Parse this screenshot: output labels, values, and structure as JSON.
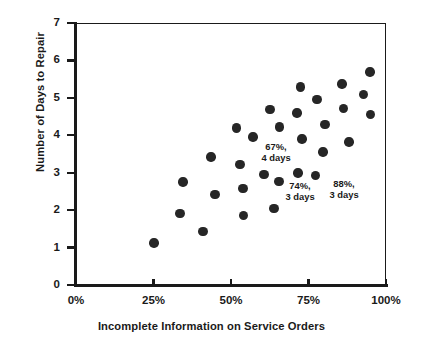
{
  "chart_data": {
    "type": "scatter",
    "title": "",
    "xlabel": "Incomplete Information on Service Orders",
    "ylabel": "Number of Days to Repair",
    "xlim": [
      0,
      100
    ],
    "ylim": [
      0,
      7
    ],
    "xticks": [
      "0%",
      "25%",
      "50%",
      "75%",
      "100%"
    ],
    "xtick_values": [
      0,
      25,
      50,
      75,
      100
    ],
    "yticks": [
      "0",
      "1",
      "2",
      "3",
      "4",
      "5",
      "6",
      "7"
    ],
    "ytick_values": [
      0,
      1,
      2,
      3,
      4,
      5,
      6,
      7
    ],
    "grid": false,
    "legend": "none",
    "marker_color": "#262626",
    "axis_color": "#1a1a1a",
    "points": [
      {
        "x": 24.8,
        "y": 1.15
      },
      {
        "x": 33.2,
        "y": 1.93
      },
      {
        "x": 34.2,
        "y": 2.78
      },
      {
        "x": 40.6,
        "y": 1.46
      },
      {
        "x": 43.2,
        "y": 3.45
      },
      {
        "x": 44.5,
        "y": 2.45
      },
      {
        "x": 51.5,
        "y": 4.22
      },
      {
        "x": 52.6,
        "y": 3.25
      },
      {
        "x": 53.5,
        "y": 2.6
      },
      {
        "x": 53.8,
        "y": 1.88
      },
      {
        "x": 56.8,
        "y": 3.98
      },
      {
        "x": 60.3,
        "y": 2.98
      },
      {
        "x": 62.3,
        "y": 4.72
      },
      {
        "x": 63.5,
        "y": 2.07
      },
      {
        "x": 65.2,
        "y": 2.8
      },
      {
        "x": 65.3,
        "y": 4.25
      },
      {
        "x": 71.0,
        "y": 4.62
      },
      {
        "x": 71.3,
        "y": 3.02
      },
      {
        "x": 72.0,
        "y": 5.32
      },
      {
        "x": 72.6,
        "y": 3.93
      },
      {
        "x": 77.0,
        "y": 2.95
      },
      {
        "x": 77.4,
        "y": 4.98
      },
      {
        "x": 79.4,
        "y": 3.58
      },
      {
        "x": 80.0,
        "y": 4.32
      },
      {
        "x": 85.5,
        "y": 5.4
      },
      {
        "x": 86.0,
        "y": 4.75
      },
      {
        "x": 87.7,
        "y": 3.85
      },
      {
        "x": 92.5,
        "y": 5.12
      },
      {
        "x": 94.5,
        "y": 5.72
      },
      {
        "x": 94.6,
        "y": 4.58
      }
    ],
    "annotations": [
      {
        "text": "67%,\n4 days",
        "x": 67,
        "y": 4.0,
        "px": 276,
        "py": 142
      },
      {
        "text": "74%,\n3 days",
        "x": 74,
        "y": 3.0,
        "px": 300,
        "py": 181
      },
      {
        "text": "88%,\n3 days",
        "x": 88,
        "y": 3.0,
        "px": 344,
        "py": 179
      }
    ]
  }
}
